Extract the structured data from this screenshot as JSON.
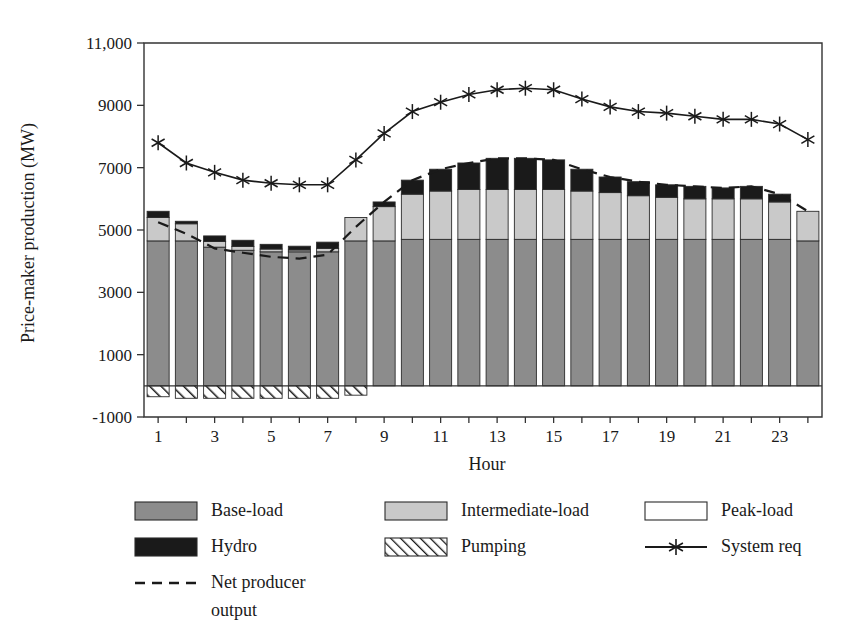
{
  "chart_data": {
    "type": "bar",
    "title": "",
    "subtitle": "",
    "xlabel": "Hour",
    "ylabel": "Price-maker production (MW)",
    "xlim": [
      0.5,
      24.5
    ],
    "ylim": [
      -1000,
      11000
    ],
    "grid": false,
    "legend_position": "bottom",
    "stacked": true,
    "categories": [
      1,
      2,
      3,
      4,
      5,
      6,
      7,
      8,
      9,
      10,
      11,
      12,
      13,
      14,
      15,
      16,
      17,
      18,
      19,
      20,
      21,
      22,
      23,
      24
    ],
    "x_tick_labels": [
      "1",
      "3",
      "5",
      "7",
      "9",
      "11",
      "13",
      "15",
      "17",
      "19",
      "21",
      "23"
    ],
    "x_tick_values": [
      1,
      3,
      5,
      7,
      9,
      11,
      13,
      15,
      17,
      19,
      21,
      23
    ],
    "y_tick_labels": [
      "-1000",
      "1000",
      "3000",
      "5000",
      "7000",
      "9000",
      "11,000"
    ],
    "y_tick_values": [
      -1000,
      1000,
      3000,
      5000,
      7000,
      9000,
      11000
    ],
    "series": [
      {
        "name": "Base-load",
        "color": "#8c8c8c",
        "fill": "solid",
        "values": [
          4650,
          4650,
          4450,
          4350,
          4300,
          4300,
          4300,
          4650,
          4650,
          4700,
          4700,
          4700,
          4700,
          4700,
          4700,
          4700,
          4700,
          4700,
          4700,
          4700,
          4700,
          4700,
          4700,
          4650
        ]
      },
      {
        "name": "Intermediate-load",
        "color": "#c9c9c9",
        "fill": "solid",
        "values": [
          750,
          550,
          180,
          120,
          90,
          60,
          110,
          750,
          1100,
          1450,
          1550,
          1600,
          1600,
          1600,
          1600,
          1550,
          1500,
          1400,
          1350,
          1300,
          1300,
          1300,
          1200,
          950
        ]
      },
      {
        "name": "Peak-load",
        "color": "#ffffff",
        "fill": "solid",
        "values": [
          0,
          0,
          0,
          0,
          0,
          0,
          0,
          0,
          0,
          0,
          0,
          0,
          0,
          0,
          0,
          0,
          0,
          0,
          0,
          0,
          0,
          0,
          0,
          0
        ]
      },
      {
        "name": "Hydro",
        "color": "#1a1a1a",
        "fill": "solid",
        "values": [
          200,
          80,
          180,
          200,
          150,
          120,
          200,
          0,
          150,
          450,
          700,
          850,
          1000,
          1000,
          950,
          700,
          500,
          450,
          400,
          400,
          350,
          400,
          250,
          0
        ]
      },
      {
        "name": "Pumping",
        "color": "#ffffff",
        "fill": "hatched",
        "values": [
          -350,
          -400,
          -400,
          -400,
          -400,
          -400,
          -400,
          -300,
          0,
          0,
          0,
          0,
          0,
          0,
          0,
          0,
          0,
          0,
          0,
          0,
          0,
          0,
          0,
          0
        ]
      }
    ],
    "lines": [
      {
        "name": "System req",
        "color": "#1a1a1a",
        "style": "solid",
        "marker": "asterisk",
        "values": [
          7800,
          7150,
          6850,
          6600,
          6500,
          6450,
          6450,
          7250,
          8100,
          8800,
          9100,
          9350,
          9500,
          9550,
          9500,
          9200,
          8950,
          8800,
          8750,
          8650,
          8550,
          8550,
          8400,
          7900
        ]
      },
      {
        "name": "Net producer output",
        "color": "#1a1a1a",
        "style": "dashed",
        "marker": "none",
        "values": [
          5250,
          4880,
          4410,
          4270,
          4140,
          4080,
          4210,
          5100,
          5900,
          6600,
          6950,
          7150,
          7300,
          7300,
          7250,
          6950,
          6700,
          6550,
          6450,
          6400,
          6350,
          6400,
          6150,
          5600
        ]
      }
    ]
  },
  "legend": {
    "items": [
      {
        "label": "Base-load",
        "swatch": "solid",
        "color": "#8c8c8c"
      },
      {
        "label": "Intermediate-load",
        "swatch": "solid",
        "color": "#c9c9c9"
      },
      {
        "label": "Peak-load",
        "swatch": "solid",
        "color": "#ffffff"
      },
      {
        "label": "Hydro",
        "swatch": "solid",
        "color": "#1a1a1a"
      },
      {
        "label": "Pumping",
        "swatch": "hatched",
        "color": "#ffffff"
      },
      {
        "label": "System req",
        "swatch": "line-marker",
        "color": "#1a1a1a"
      },
      {
        "label": "Net producer",
        "label2": "output",
        "swatch": "dashed-line",
        "color": "#1a1a1a"
      }
    ]
  }
}
